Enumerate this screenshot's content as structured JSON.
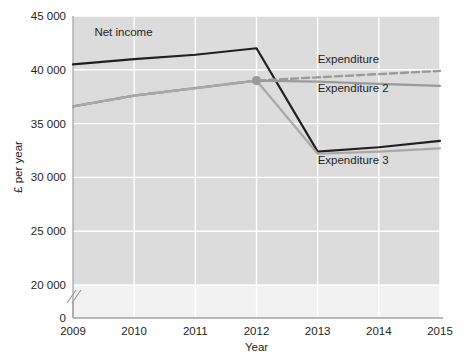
{
  "chart_data": {
    "type": "line",
    "title": "",
    "xlabel": "Year",
    "ylabel": "£ per year",
    "categories": [
      "2009",
      "2010",
      "2011",
      "2012",
      "2013",
      "2014",
      "2015"
    ],
    "x": [
      2009,
      2010,
      2011,
      2012,
      2013,
      2014,
      2015
    ],
    "xlim": [
      2009,
      2015
    ],
    "ylim": [
      20000,
      45000
    ],
    "y_axis_break": true,
    "y_zero_label": "0",
    "yticks": [
      20000,
      25000,
      30000,
      35000,
      40000,
      45000
    ],
    "ytick_labels": [
      "20 000",
      "25 000",
      "30 000",
      "35 000",
      "40 000",
      "45 000"
    ],
    "grid": true,
    "grid_color": "#ffffff",
    "plot_background": "#dcdcdc",
    "legend_position": "inline-annotations",
    "marker_year": 2012,
    "marker_value": 39000,
    "marker_color": "#9a9a9a",
    "series": [
      {
        "name": "Net income",
        "color": "#231f20",
        "style": "solid",
        "width": 2.2,
        "values": [
          40500,
          41000,
          41400,
          42000,
          32400,
          32800,
          33400
        ],
        "label_x": 2009.35,
        "label_y": 43100
      },
      {
        "name": "Expenditure",
        "color": "#9a9a9a",
        "style": "dashed",
        "width": 2.4,
        "values": [
          36600,
          37600,
          38300,
          39000,
          39300,
          39600,
          39900
        ],
        "label_x": 2013.0,
        "label_y": 40600
      },
      {
        "name": "Expenditure 2",
        "color": "#9a9a9a",
        "style": "solid",
        "width": 2.2,
        "values": [
          36600,
          37600,
          38300,
          39000,
          38900,
          38700,
          38500
        ],
        "label_x": 2013.0,
        "label_y": 37900
      },
      {
        "name": "Expenditure 3",
        "color": "#a8a8a8",
        "style": "solid",
        "width": 2.2,
        "values": [
          36600,
          37600,
          38300,
          39000,
          32200,
          32400,
          32700
        ],
        "label_x": 2013.0,
        "label_y": 31200
      }
    ]
  }
}
